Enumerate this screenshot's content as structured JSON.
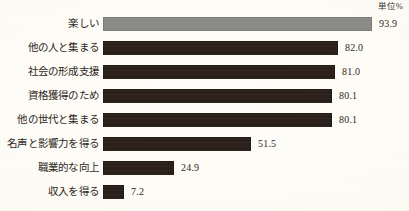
{
  "unit_caption": "単位%",
  "chart_data": {
    "type": "bar",
    "orientation": "horizontal",
    "title": "",
    "subtitle": "",
    "xlabel": "",
    "ylabel": "",
    "unit_label": "単位%",
    "grid": false,
    "legend": null,
    "xlim": [
      0,
      100
    ],
    "value_label_format": "one_decimal",
    "categories": [
      "楽しい",
      "他の人と集まる",
      "社会の形成支援",
      "資格獲得のため",
      "他の世代と集まる",
      "名声と影響力を得る",
      "職業的な向上",
      "収入を得る"
    ],
    "values": [
      93.9,
      82.0,
      81.0,
      80.1,
      80.1,
      51.5,
      24.9,
      7.2
    ],
    "value_labels": [
      "93.9",
      "82.0",
      "81.0",
      "80.1",
      "80.1",
      "51.5",
      "24.9",
      "7.2"
    ],
    "bar_colors": [
      "#8b8b87",
      "#2b1f19",
      "#2b1f19",
      "#2b1f19",
      "#2b1f19",
      "#2b1f19",
      "#2b1f19",
      "#2b1f19"
    ],
    "highlight_category": "楽しい",
    "colors": {
      "highlight_bar": "#8b8b87",
      "bar": "#2b1f19",
      "text": "#2e2722",
      "background": "#fdfcf6"
    },
    "bars": [
      {
        "label": "楽しい",
        "value": 93.9,
        "value_label": "93.9",
        "color": "#8b8b87"
      },
      {
        "label": "他の人と集まる",
        "value": 82.0,
        "value_label": "82.0",
        "color": "#2b1f19"
      },
      {
        "label": "社会の形成支援",
        "value": 81.0,
        "value_label": "81.0",
        "color": "#2b1f19"
      },
      {
        "label": "資格獲得のため",
        "value": 80.1,
        "value_label": "80.1",
        "color": "#2b1f19"
      },
      {
        "label": "他の世代と集まる",
        "value": 80.1,
        "value_label": "80.1",
        "color": "#2b1f19"
      },
      {
        "label": "名声と影響力を得る",
        "value": 51.5,
        "value_label": "51.5",
        "color": "#2b1f19"
      },
      {
        "label": "職業的な向上",
        "value": 24.9,
        "value_label": "24.9",
        "color": "#2b1f19"
      },
      {
        "label": "収入を得る",
        "value": 7.2,
        "value_label": "7.2",
        "color": "#2b1f19"
      }
    ]
  }
}
